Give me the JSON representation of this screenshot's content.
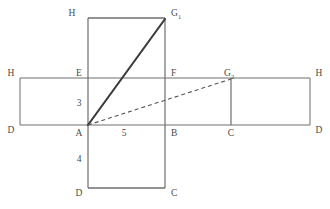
{
  "figure": {
    "background_color": "#ffffff",
    "line_color": "#6e6e6e",
    "thick_line_color": "#3a3a3a",
    "dashed_line_color": "#555555",
    "label_color": "#4a4a4a"
  },
  "vertex_labels": {
    "top_rect_top_left": "H",
    "top_rect_top_right": "G",
    "top_rect_top_right_sub": "1",
    "mid_left_outer": "H",
    "mid_left_inner": "E",
    "mid_right_inner": "F",
    "mid_g2": "G",
    "mid_g2_sub": "2",
    "mid_right_outer": "H",
    "bottom_left_outer": "D",
    "corner_a": "A",
    "corner_b": "B",
    "corner_c": "C",
    "bottom_right_outer": "D",
    "lower_rect_bottom_left": "D",
    "lower_rect_bottom_right": "C"
  },
  "dimension_labels": {
    "height_ae": "3",
    "width_ab": "5",
    "depth_ad": "4"
  },
  "paths": {
    "solid_label": "A-G1",
    "dashed_label": "A-G2"
  }
}
